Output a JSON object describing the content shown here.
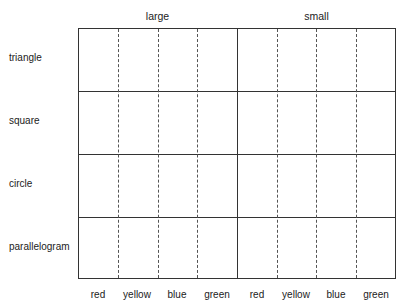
{
  "groups": [
    "large",
    "small"
  ],
  "rows": [
    "triangle",
    "square",
    "circle",
    "parallelogram"
  ],
  "columns": [
    "red",
    "yellow",
    "blue",
    "green",
    "red",
    "yellow",
    "blue",
    "green"
  ]
}
